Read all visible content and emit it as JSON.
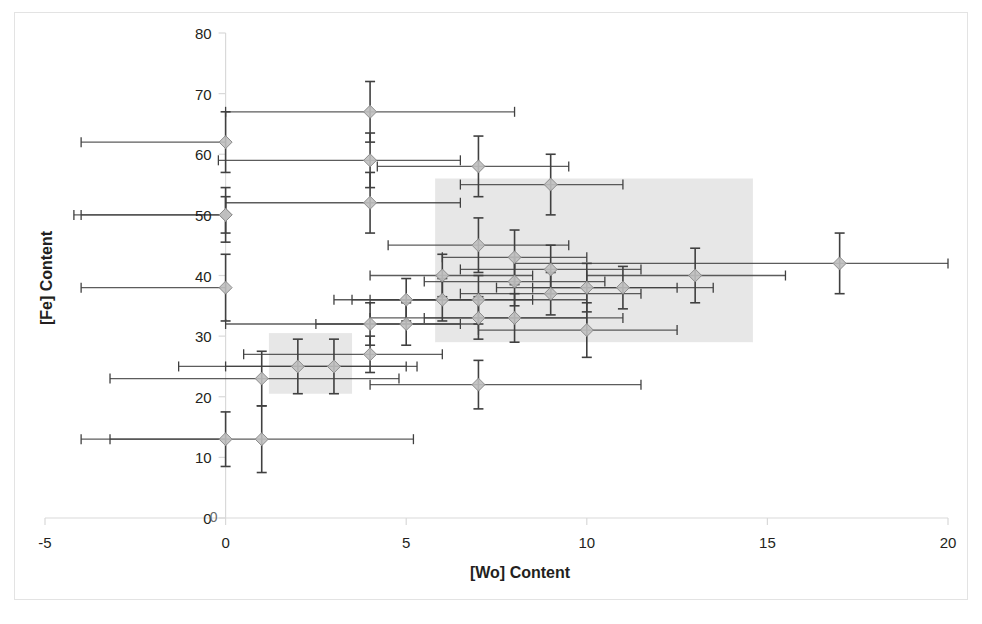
{
  "chart_data": {
    "type": "scatter",
    "title": "",
    "xlabel": "[Wo] Content",
    "ylabel": "[Fe] Content",
    "xlim": [
      -5,
      20
    ],
    "ylim": [
      0,
      80
    ],
    "xticks": [
      -5,
      0,
      5,
      10,
      15,
      20
    ],
    "yticks": [
      0,
      10,
      20,
      30,
      40,
      50,
      60,
      70,
      80
    ],
    "xtick_labels": [
      "-5",
      "0",
      "5",
      "10",
      "15",
      "20"
    ],
    "ytick_labels": [
      "0",
      "10",
      "20",
      "30",
      "40",
      "50",
      "60",
      "70",
      "80"
    ],
    "grid": false,
    "legend": "none",
    "marker": "diamond",
    "marker_fill": "#bfbfbf",
    "marker_edge": "#8c8c8c",
    "errorbar_color": "#404040",
    "axis_color": "#d9d9d9",
    "zero_line_label": "0",
    "shaded_regions": [
      {
        "name": "upper-field",
        "x0": 5.8,
        "x1": 14.6,
        "y0": 29.0,
        "y1": 56.0,
        "color": "#d4d4d4",
        "opacity": 0.55
      },
      {
        "name": "lower-field",
        "x0": 1.2,
        "x1": 3.5,
        "y0": 20.5,
        "y1": 30.5,
        "color": "#d4d4d4",
        "opacity": 0.55
      }
    ],
    "points": [
      {
        "x": 0,
        "y": 62,
        "xerr_lo": 4.0,
        "xerr_hi": 0.0,
        "yerr": 5.0
      },
      {
        "x": 0,
        "y": 50,
        "xerr_lo": 4.0,
        "xerr_hi": 0.0,
        "yerr": 3.0
      },
      {
        "x": 0,
        "y": 50,
        "xerr_lo": 4.2,
        "xerr_hi": 0.0,
        "yerr": 4.5
      },
      {
        "x": 0,
        "y": 38,
        "xerr_lo": 4.0,
        "xerr_hi": 0.0,
        "yerr": 5.5
      },
      {
        "x": 0,
        "y": 13,
        "xerr_lo": 4.0,
        "xerr_hi": 0.0,
        "yerr": 4.5
      },
      {
        "x": 1,
        "y": 13,
        "xerr_lo": 4.2,
        "xerr_hi": 4.2,
        "yerr": 5.5
      },
      {
        "x": 1,
        "y": 23,
        "xerr_lo": 4.2,
        "xerr_hi": 3.8,
        "yerr": 4.5
      },
      {
        "x": 2,
        "y": 25,
        "xerr_lo": 3.3,
        "xerr_hi": 3.3,
        "yerr": 4.5
      },
      {
        "x": 3,
        "y": 25,
        "xerr_lo": 3.0,
        "xerr_hi": 2.0,
        "yerr": 4.5
      },
      {
        "x": 4,
        "y": 67,
        "xerr_lo": 4.0,
        "xerr_hi": 4.0,
        "yerr": 5.0
      },
      {
        "x": 4,
        "y": 59,
        "xerr_lo": 4.2,
        "xerr_hi": 2.5,
        "yerr": 4.5
      },
      {
        "x": 4,
        "y": 52,
        "xerr_lo": 4.0,
        "xerr_hi": 2.5,
        "yerr": 5.0
      },
      {
        "x": 4,
        "y": 32,
        "xerr_lo": 4.0,
        "xerr_hi": 2.5,
        "yerr": 3.5
      },
      {
        "x": 4,
        "y": 27,
        "xerr_lo": 3.5,
        "xerr_hi": 2.0,
        "yerr": 3.0
      },
      {
        "x": 5,
        "y": 32,
        "xerr_lo": 2.5,
        "xerr_hi": 2.0,
        "yerr": 3.5
      },
      {
        "x": 5,
        "y": 36,
        "xerr_lo": 2.0,
        "xerr_hi": 2.0,
        "yerr": 3.5
      },
      {
        "x": 6,
        "y": 36,
        "xerr_lo": 2.5,
        "xerr_hi": 2.5,
        "yerr": 3.5
      },
      {
        "x": 6,
        "y": 40,
        "xerr_lo": 2.0,
        "xerr_hi": 2.5,
        "yerr": 3.5
      },
      {
        "x": 7,
        "y": 58,
        "xerr_lo": 2.8,
        "xerr_hi": 2.5,
        "yerr": 5.0
      },
      {
        "x": 7,
        "y": 45,
        "xerr_lo": 2.5,
        "xerr_hi": 2.5,
        "yerr": 4.5
      },
      {
        "x": 7,
        "y": 36,
        "xerr_lo": 3.0,
        "xerr_hi": 3.0,
        "yerr": 4.0
      },
      {
        "x": 7,
        "y": 33,
        "xerr_lo": 3.0,
        "xerr_hi": 3.0,
        "yerr": 3.5
      },
      {
        "x": 7,
        "y": 22,
        "xerr_lo": 3.0,
        "xerr_hi": 4.5,
        "yerr": 4.0
      },
      {
        "x": 8,
        "y": 43,
        "xerr_lo": 2.0,
        "xerr_hi": 2.0,
        "yerr": 4.5
      },
      {
        "x": 8,
        "y": 39,
        "xerr_lo": 2.5,
        "xerr_hi": 2.5,
        "yerr": 4.0
      },
      {
        "x": 8,
        "y": 33,
        "xerr_lo": 2.5,
        "xerr_hi": 3.0,
        "yerr": 4.0
      },
      {
        "x": 9,
        "y": 55,
        "xerr_lo": 2.5,
        "xerr_hi": 2.0,
        "yerr": 5.0
      },
      {
        "x": 9,
        "y": 41,
        "xerr_lo": 2.5,
        "xerr_hi": 2.5,
        "yerr": 4.0
      },
      {
        "x": 9,
        "y": 37,
        "xerr_lo": 2.5,
        "xerr_hi": 2.5,
        "yerr": 3.5
      },
      {
        "x": 10,
        "y": 38,
        "xerr_lo": 2.5,
        "xerr_hi": 2.5,
        "yerr": 4.0
      },
      {
        "x": 10,
        "y": 31,
        "xerr_lo": 3.0,
        "xerr_hi": 2.5,
        "yerr": 4.5
      },
      {
        "x": 11,
        "y": 38,
        "xerr_lo": 2.5,
        "xerr_hi": 2.5,
        "yerr": 3.5
      },
      {
        "x": 13,
        "y": 40,
        "xerr_lo": 3.0,
        "xerr_hi": 2.5,
        "yerr": 4.5
      },
      {
        "x": 17,
        "y": 42,
        "xerr_lo": 9.0,
        "xerr_hi": 3.0,
        "yerr": 5.0
      }
    ]
  }
}
